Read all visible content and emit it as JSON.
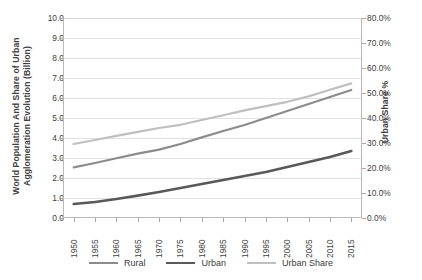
{
  "chart_data": {
    "type": "line",
    "title": "",
    "xlabel": "",
    "ylabel": "World Population And Share of Urban Agglomeration Evolution (Billion)",
    "y2label": "Urban Share %",
    "categories": [
      "1950",
      "1955",
      "1960",
      "1965",
      "1970",
      "1975",
      "1980",
      "1985",
      "1990",
      "1995",
      "2000",
      "2005",
      "2010",
      "2015"
    ],
    "ylim": [
      0,
      10
    ],
    "ytick_labels": [
      "0.0",
      "1.0",
      "2.0",
      "3.0",
      "4.0",
      "5.0",
      "6.0",
      "7.0",
      "8.0",
      "9.0",
      "10.0"
    ],
    "ytick_values": [
      0,
      1,
      2,
      3,
      4,
      5,
      6,
      7,
      8,
      9,
      10
    ],
    "y2lim": [
      0,
      80
    ],
    "y2tick_labels": [
      "0.0%",
      "10.0%",
      "20.0%",
      "30.0%",
      "40.0%",
      "50.0%",
      "60.0%",
      "70.0%",
      "80.0%"
    ],
    "y2tick_values": [
      0,
      10,
      20,
      30,
      40,
      50,
      60,
      70,
      80
    ],
    "grid": true,
    "legend_position": "bottom",
    "series": [
      {
        "name": "Rural",
        "axis": "left",
        "color": "#8c8c8c",
        "width": 2.2,
        "values": [
          2.53,
          2.75,
          2.99,
          3.22,
          3.42,
          3.7,
          4.03,
          4.35,
          4.65,
          5.0,
          5.35,
          5.7,
          6.05,
          6.4
        ]
      },
      {
        "name": "Urban",
        "axis": "left",
        "color": "#595959",
        "width": 2.6,
        "values": [
          0.7,
          0.8,
          0.95,
          1.12,
          1.3,
          1.5,
          1.7,
          1.9,
          2.1,
          2.3,
          2.55,
          2.8,
          3.05,
          3.35
        ]
      },
      {
        "name": "Urban Share",
        "axis": "right",
        "color": "#bfbfbf",
        "width": 2.2,
        "values": [
          29.6,
          31.2,
          32.9,
          34.5,
          36.0,
          37.3,
          39.2,
          41.1,
          43.0,
          44.7,
          46.5,
          48.6,
          51.3,
          53.8
        ]
      }
    ],
    "series_left_plot_values": {
      "Rural": [
        2.53,
        2.75,
        2.99,
        3.22,
        3.42,
        3.7,
        4.03,
        4.35,
        4.65,
        5.0,
        5.35,
        5.7,
        6.05,
        6.4
      ],
      "Urban": [
        0.7,
        0.8,
        0.95,
        1.12,
        1.3,
        1.5,
        1.7,
        1.9,
        2.1,
        2.3,
        2.55,
        2.8,
        3.05,
        3.35
      ],
      "Urban Share": [
        3.7,
        3.9,
        4.11,
        4.31,
        4.5,
        4.66,
        4.9,
        5.14,
        5.38,
        5.59,
        5.81,
        6.08,
        6.41,
        6.73
      ]
    }
  },
  "legend": {
    "items": [
      {
        "label": "Rural",
        "color": "#8c8c8c"
      },
      {
        "label": "Urban",
        "color": "#595959"
      },
      {
        "label": "Urban Share",
        "color": "#bfbfbf"
      }
    ]
  }
}
